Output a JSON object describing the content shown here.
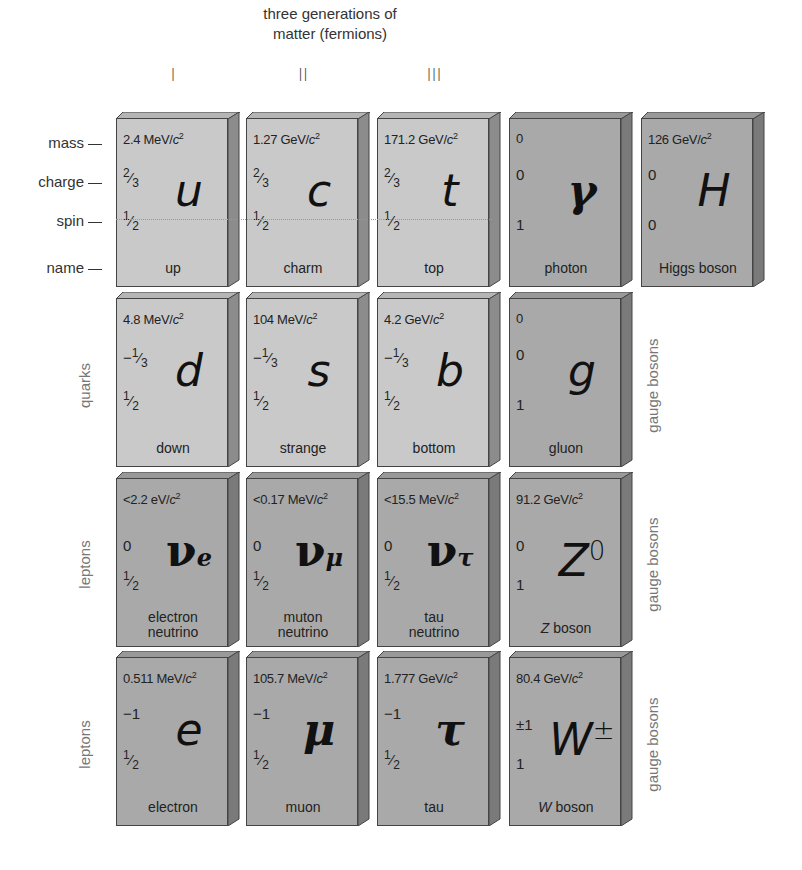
{
  "header": {
    "title_line1": "three generations of",
    "title_line2": "matter (fermions)",
    "generations": [
      "I",
      "II",
      "III"
    ]
  },
  "row_labels": {
    "mass": "mass",
    "charge": "charge",
    "spin": "spin",
    "name": "name"
  },
  "side_labels": {
    "quarks": "quarks",
    "leptons_1": "leptons",
    "leptons_2": "leptons",
    "gauge_bosons_1": "gauge bosons",
    "gauge_bosons_2": "gauge bosons",
    "gauge_bosons_3": "gauge bosons"
  },
  "colors": {
    "quark_card": "#c9c9c9",
    "lepton_boson_card": "#a9a9a9",
    "side_label": "#777777"
  },
  "particles": {
    "up": {
      "mass": "2.4 MeV/",
      "charge": "2/3",
      "spin": "1/2",
      "symbol": "u",
      "name": "up"
    },
    "charm": {
      "mass": "1.27 GeV/",
      "charge": "2/3",
      "spin": "1/2",
      "symbol": "c",
      "name": "charm"
    },
    "top": {
      "mass": "171.2 GeV/",
      "charge": "2/3",
      "spin": "1/2",
      "symbol": "t",
      "name": "top"
    },
    "photon": {
      "mass": "0",
      "charge": "0",
      "spin": "1",
      "symbol": "γ",
      "name": "photon"
    },
    "higgs": {
      "mass": "126 GeV/",
      "charge": "0",
      "spin": "0",
      "symbol": "H",
      "name": "Higgs boson"
    },
    "down": {
      "mass": "4.8 MeV/",
      "charge": "−1/3",
      "spin": "1/2",
      "symbol": "d",
      "name": "down"
    },
    "strange": {
      "mass": "104 MeV/",
      "charge": "−1/3",
      "spin": "1/2",
      "symbol": "s",
      "name": "strange"
    },
    "bottom": {
      "mass": "4.2 GeV/",
      "charge": "−1/3",
      "spin": "1/2",
      "symbol": "b",
      "name": "bottom"
    },
    "gluon": {
      "mass": "0",
      "charge": "0",
      "spin": "1",
      "symbol": "g",
      "name": "gluon"
    },
    "nu_e": {
      "mass": "<2.2 eV/",
      "charge": "0",
      "spin": "1/2",
      "symbol": "ν",
      "symbol_sub": "e",
      "name_line1": "electron",
      "name_line2": "neutrino"
    },
    "nu_mu": {
      "mass": "<0.17 MeV/",
      "charge": "0",
      "spin": "1/2",
      "symbol": "ν",
      "symbol_sub": "μ",
      "name_line1": "muton",
      "name_line2": "neutrino"
    },
    "nu_tau": {
      "mass": "<15.5 MeV/",
      "charge": "0",
      "spin": "1/2",
      "symbol": "ν",
      "symbol_sub": "τ",
      "name_line1": "tau",
      "name_line2": "neutrino"
    },
    "z": {
      "mass": "91.2 GeV/",
      "charge": "0",
      "spin": "1",
      "symbol": "Z",
      "symbol_sup": "0",
      "name_italic": "Z",
      "name_rest": " boson"
    },
    "electron": {
      "mass": "0.511 MeV/",
      "charge": "−1",
      "spin": "1/2",
      "symbol": "e",
      "name": "electron"
    },
    "muon": {
      "mass": "105.7 MeV/",
      "charge": "−1",
      "spin": "1/2",
      "symbol": "μ",
      "name": "muon"
    },
    "tau": {
      "mass": "1.777 GeV/",
      "charge": "−1",
      "spin": "1/2",
      "symbol": "τ",
      "name": "tau"
    },
    "w": {
      "mass": "80.4 GeV/",
      "charge": "±1",
      "spin": "1",
      "symbol": "W",
      "symbol_sup": "±",
      "name_italic": "W",
      "name_rest": " boson"
    }
  },
  "units": {
    "c_squared": "c",
    "squared": "2"
  }
}
